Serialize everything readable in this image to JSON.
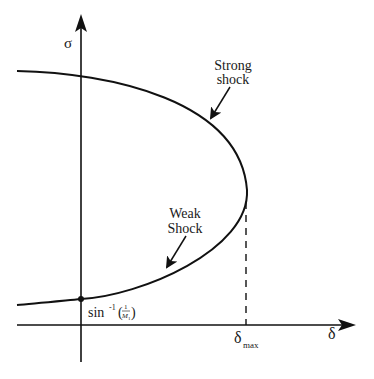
{
  "diagram": {
    "type": "theta-beta-mach shock polar",
    "axes": {
      "y_label": "σ",
      "x_label": "δ"
    },
    "annotations": {
      "strong_line1": "Strong",
      "strong_line2": "shock",
      "weak_line1": "Weak",
      "weak_line2": "Shock",
      "intercept_prefix": "sin",
      "intercept_exp": "-1",
      "intercept_open": "(",
      "intercept_num": "1",
      "intercept_den": "M",
      "intercept_den_sub": "1",
      "intercept_close": ")",
      "delta_max": "δ",
      "delta_max_sub": "max"
    },
    "colors": {
      "line": "#111111",
      "background": "#ffffff"
    }
  }
}
